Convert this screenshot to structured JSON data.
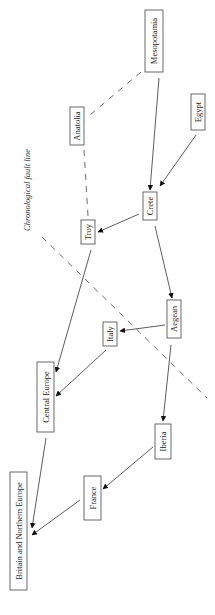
{
  "diagram": {
    "type": "flow-diagram",
    "orientation": "rotated-90-ccw",
    "fault_line_label": "Chronological fault line",
    "nodes": [
      {
        "id": "mesopotamia",
        "label": "Mesopotamia",
        "x": 145,
        "y": 10,
        "w": 18,
        "h": 62
      },
      {
        "id": "egypt",
        "label": "Egypt",
        "x": 191,
        "y": 94,
        "w": 14,
        "h": 36
      },
      {
        "id": "anatolia",
        "label": "Anatolia",
        "x": 70,
        "y": 107,
        "w": 14,
        "h": 38
      },
      {
        "id": "crete",
        "label": "Crete",
        "x": 143,
        "y": 192,
        "w": 14,
        "h": 28
      },
      {
        "id": "troy",
        "label": "Troy",
        "x": 81,
        "y": 220,
        "w": 14,
        "h": 24
      },
      {
        "id": "aegean",
        "label": "Aegean",
        "x": 167,
        "y": 300,
        "w": 14,
        "h": 38
      },
      {
        "id": "italy",
        "label": "Italy",
        "x": 103,
        "y": 322,
        "w": 14,
        "h": 24
      },
      {
        "id": "central_europe",
        "label": "Central Europe",
        "x": 37,
        "y": 362,
        "w": 17,
        "h": 70
      },
      {
        "id": "iberia",
        "label": "Iberia",
        "x": 155,
        "y": 424,
        "w": 16,
        "h": 35
      },
      {
        "id": "france",
        "label": "France",
        "x": 84,
        "y": 476,
        "w": 17,
        "h": 44
      },
      {
        "id": "britain",
        "label": "Britain and Northern Europe",
        "x": 10,
        "y": 472,
        "w": 17,
        "h": 118
      }
    ],
    "edges": [
      {
        "from": "mesopotamia",
        "to": "crete",
        "style": "solid-arrow"
      },
      {
        "from": "egypt",
        "to": "crete",
        "style": "solid-arrow"
      },
      {
        "from": "crete",
        "to": "troy",
        "style": "solid-arrow"
      },
      {
        "from": "crete",
        "to": "aegean",
        "style": "solid-arrow"
      },
      {
        "from": "aegean",
        "to": "italy",
        "style": "solid-arrow"
      },
      {
        "from": "aegean",
        "to": "iberia",
        "style": "solid-arrow"
      },
      {
        "from": "troy",
        "to": "central_europe",
        "style": "solid-arrow"
      },
      {
        "from": "italy",
        "to": "central_europe",
        "style": "solid-arrow"
      },
      {
        "from": "central_europe",
        "to": "britain",
        "style": "solid-arrow"
      },
      {
        "from": "iberia",
        "to": "france",
        "style": "solid-arrow"
      },
      {
        "from": "france",
        "to": "britain",
        "style": "solid-arrow"
      },
      {
        "from": "mesopotamia",
        "to": "anatolia",
        "style": "dashed"
      },
      {
        "from": "anatolia",
        "to": "troy",
        "style": "dashed"
      }
    ]
  }
}
